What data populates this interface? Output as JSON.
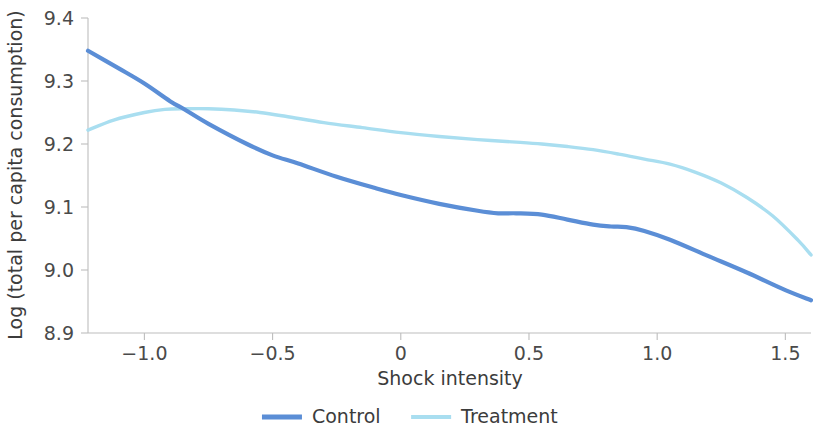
{
  "chart_data": {
    "type": "line",
    "title": "",
    "xlabel": "Shock intensity",
    "ylabel": "Log (total per capita consumption)",
    "xlim": [
      -1.22,
      1.6
    ],
    "ylim": [
      8.9,
      9.4
    ],
    "xticks": [
      -1.0,
      -0.5,
      0,
      0.5,
      1.0,
      1.5
    ],
    "xticklabels": [
      "−1.0",
      "−0.5",
      "0",
      "0.5",
      "1.0",
      "1.5"
    ],
    "yticks": [
      8.9,
      9.0,
      9.1,
      9.2,
      9.3,
      9.4
    ],
    "yticklabels": [
      "8.9",
      "9.0",
      "9.1",
      "9.2",
      "9.3",
      "9.4"
    ],
    "grid": false,
    "legend_position": "below",
    "series": [
      {
        "name": "Control",
        "color": "#5b8ed6",
        "linewidth": 4.2,
        "x": [
          -1.22,
          -1.1,
          -1.0,
          -0.9,
          -0.84,
          -0.75,
          -0.6,
          -0.5,
          -0.4,
          -0.25,
          -0.1,
          0.0,
          0.15,
          0.3,
          0.38,
          0.45,
          0.55,
          0.65,
          0.75,
          0.82,
          0.88,
          0.95,
          1.05,
          1.2,
          1.35,
          1.5,
          1.6
        ],
        "y": [
          9.348,
          9.32,
          9.296,
          9.268,
          9.254,
          9.232,
          9.2,
          9.182,
          9.169,
          9.148,
          9.13,
          9.119,
          9.105,
          9.094,
          9.09,
          9.09,
          9.088,
          9.08,
          9.072,
          9.069,
          9.068,
          9.062,
          9.048,
          9.022,
          8.996,
          8.968,
          8.952
        ]
      },
      {
        "name": "Treatment",
        "color": "#a9def0",
        "linewidth": 3.4,
        "x": [
          -1.22,
          -1.12,
          -1.0,
          -0.92,
          -0.84,
          -0.75,
          -0.65,
          -0.55,
          -0.45,
          -0.3,
          -0.15,
          0.0,
          0.15,
          0.3,
          0.45,
          0.55,
          0.65,
          0.75,
          0.85,
          0.95,
          1.05,
          1.15,
          1.25,
          1.35,
          1.45,
          1.55,
          1.6
        ],
        "y": [
          9.222,
          9.238,
          9.25,
          9.255,
          9.256,
          9.256,
          9.254,
          9.25,
          9.244,
          9.234,
          9.226,
          9.218,
          9.212,
          9.207,
          9.203,
          9.2,
          9.196,
          9.191,
          9.184,
          9.176,
          9.168,
          9.155,
          9.138,
          9.115,
          9.086,
          9.047,
          9.024
        ]
      }
    ],
    "legend": [
      {
        "label": "Control",
        "color": "#5b8ed6"
      },
      {
        "label": "Treatment",
        "color": "#a9def0"
      }
    ]
  },
  "axes": {
    "x_axis_title": "Shock intensity",
    "y_axis_title": "Log (total per capita consumption)"
  }
}
